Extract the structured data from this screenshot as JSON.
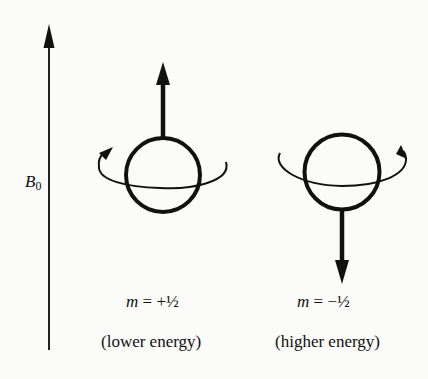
{
  "field": {
    "symbol": "B",
    "subscript": "0",
    "label": "B0"
  },
  "states": [
    {
      "id": "spin-up",
      "variable": "m",
      "equals": "=",
      "value": "+½",
      "description": "(lower energy)",
      "moment_direction": "up"
    },
    {
      "id": "spin-down",
      "variable": "m",
      "equals": "=",
      "value": "−½",
      "description": "(higher energy)",
      "moment_direction": "down"
    }
  ],
  "colors": {
    "background": "#fbfbfa",
    "ink": "#111111"
  }
}
